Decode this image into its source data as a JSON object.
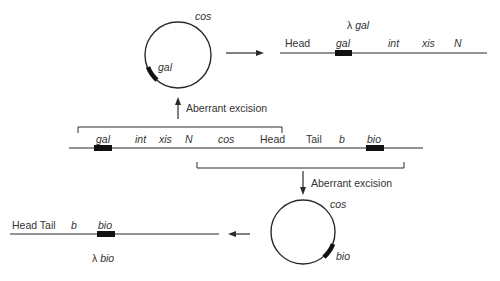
{
  "diagram": {
    "top_circle": {
      "cos_label": "cos",
      "gene_label": "gal"
    },
    "lambda_gal": {
      "title_prefix": "λ",
      "title_gene": "gal",
      "labels": [
        "Head",
        "gal",
        "int",
        "xis",
        "N"
      ]
    },
    "upper_excision_label": "Aberrant excision",
    "integrated_prophage": {
      "labels": [
        "gal",
        "int",
        "xis",
        "N",
        "cos",
        "Head",
        "Tail",
        "b",
        "bio"
      ]
    },
    "lower_excision_label": "Aberrant excision",
    "bottom_circle": {
      "cos_label": "cos",
      "gene_label": "bio"
    },
    "lambda_bio": {
      "labels": [
        "Head Tail",
        "b",
        "bio"
      ],
      "title_prefix": "λ",
      "title_gene": "bio"
    },
    "colors": {
      "line": "#2a2a2a",
      "gene_box": "#111111",
      "background": "#ffffff"
    }
  }
}
